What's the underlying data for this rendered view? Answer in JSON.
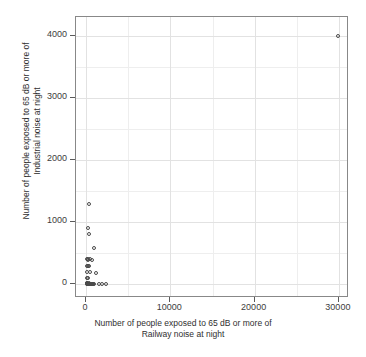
{
  "chart_data": {
    "type": "scatter",
    "title": "",
    "xlabel": "Number of people exposed to 65 dB or more of Railway noise at night",
    "ylabel": "Number of people exposed to 65 dB or more of Industrial noise at night",
    "xlabel_lines": [
      "Number of people exposed to 65 dB or more of",
      "Railway noise at night"
    ],
    "ylabel_lines": [
      "Number of people exposed to 65 dB or more of",
      "Industrial noise at night"
    ],
    "xlim": [
      -1200,
      31200
    ],
    "ylim": [
      -220,
      4300
    ],
    "xticks": [
      0,
      10000,
      20000,
      30000
    ],
    "yticks": [
      0,
      1000,
      2000,
      3000,
      4000
    ],
    "xticklabels": [
      "0",
      "10000",
      "20000",
      "30000"
    ],
    "yticklabels": [
      "0",
      "1000",
      "2000",
      "3000",
      "4000"
    ],
    "x_minor_ticks": [
      5000,
      15000,
      25000
    ],
    "y_minor_ticks": [
      500,
      1500,
      2500,
      3500
    ],
    "grid": true,
    "grid_major_color": "#e2e2e2",
    "grid_minor_color": "#eeeeee",
    "panel_background": "#ffffff",
    "panel_border_color": "#888888",
    "marker": "open-circle",
    "marker_color": "#4a4a4a",
    "marker_size_px": 4,
    "legend": "none",
    "n_points": 46,
    "points": [
      {
        "x": 29900,
        "y": 3990
      },
      {
        "x": 330,
        "y": 1290
      },
      {
        "x": 210,
        "y": 900
      },
      {
        "x": 300,
        "y": 810
      },
      {
        "x": 900,
        "y": 590
      },
      {
        "x": 90,
        "y": 400
      },
      {
        "x": 170,
        "y": 400
      },
      {
        "x": 250,
        "y": 395
      },
      {
        "x": 430,
        "y": 400
      },
      {
        "x": 730,
        "y": 395
      },
      {
        "x": 110,
        "y": 300
      },
      {
        "x": 200,
        "y": 295
      },
      {
        "x": 290,
        "y": 300
      },
      {
        "x": 150,
        "y": 200
      },
      {
        "x": 520,
        "y": 200
      },
      {
        "x": 1120,
        "y": 190
      },
      {
        "x": 120,
        "y": 105
      },
      {
        "x": 240,
        "y": 100
      },
      {
        "x": 60,
        "y": 20
      },
      {
        "x": 110,
        "y": 15
      },
      {
        "x": 160,
        "y": 10
      },
      {
        "x": 210,
        "y": 12
      },
      {
        "x": 260,
        "y": 8
      },
      {
        "x": 310,
        "y": 14
      },
      {
        "x": 360,
        "y": 6
      },
      {
        "x": 410,
        "y": 10
      },
      {
        "x": 460,
        "y": 5
      },
      {
        "x": 510,
        "y": 9
      },
      {
        "x": 560,
        "y": 4
      },
      {
        "x": 610,
        "y": 11
      },
      {
        "x": 660,
        "y": 3
      },
      {
        "x": 710,
        "y": 8
      },
      {
        "x": 760,
        "y": 5
      },
      {
        "x": 810,
        "y": 2
      },
      {
        "x": 860,
        "y": 7
      },
      {
        "x": 910,
        "y": 4
      },
      {
        "x": 80,
        "y": 0
      },
      {
        "x": 180,
        "y": 0
      },
      {
        "x": 280,
        "y": 0
      },
      {
        "x": 380,
        "y": 0
      },
      {
        "x": 480,
        "y": 0
      },
      {
        "x": 580,
        "y": 0
      },
      {
        "x": 690,
        "y": 0
      },
      {
        "x": 1530,
        "y": 5
      },
      {
        "x": 1900,
        "y": 5
      },
      {
        "x": 2400,
        "y": 5
      }
    ]
  }
}
